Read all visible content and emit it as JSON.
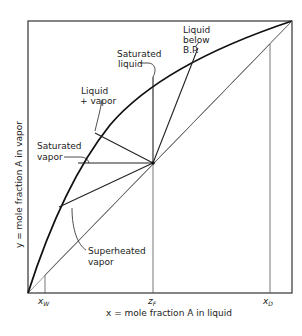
{
  "diagram": {
    "type": "mccabe-thiele-feed-lines",
    "xlabel": "x = mole fraction A in liquid",
    "ylabel": "y = mole fraction A in vapor",
    "x_ticks": {
      "xw": "x",
      "xw_sub": "W",
      "zf": "z",
      "zf_sub": "F",
      "xd": "x",
      "xd_sub": "D"
    },
    "labels": {
      "saturated_liquid_1": "Saturated",
      "saturated_liquid_2": "liquid",
      "liquid_below_bp_1": "Liquid",
      "liquid_below_bp_2": "below",
      "liquid_below_bp_3": "B.P.",
      "liquid_vapor_1": "Liquid",
      "liquid_vapor_2": "+ vapor",
      "saturated_vapor_1": "Saturated",
      "saturated_vapor_2": "vapor",
      "superheated_vapor_1": "Superheated",
      "superheated_vapor_2": "vapor"
    },
    "colors": {
      "line": "#222222",
      "thin": "#555555"
    }
  }
}
